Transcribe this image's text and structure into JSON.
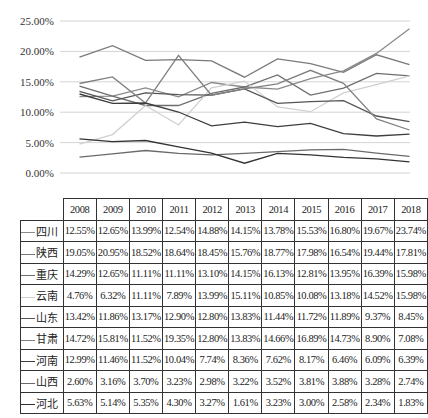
{
  "chart_data": {
    "type": "line",
    "title": "",
    "xlabel": "",
    "ylabel": "",
    "ylim": [
      0,
      25
    ],
    "grid": true,
    "legend_position": "table-left",
    "y_ticks": [
      "25.00%",
      "20.00%",
      "15.00%",
      "10.00%",
      "5.00%",
      "0.00%"
    ],
    "categories": [
      "2008",
      "2009",
      "2010",
      "2011",
      "2012",
      "2013",
      "2014",
      "2015",
      "2016",
      "2017",
      "2018"
    ],
    "series": [
      {
        "name": "四川",
        "color": "#8a8a8a",
        "values": [
          12.55,
          12.65,
          13.99,
          12.54,
          14.88,
          14.15,
          13.78,
          15.53,
          16.8,
          19.67,
          23.74
        ],
        "labels": [
          "12.55%",
          "12.65%",
          "13.99%",
          "12.54%",
          "14.88%",
          "14.15%",
          "13.78%",
          "15.53%",
          "16.80%",
          "19.67%",
          "23.74%"
        ]
      },
      {
        "name": "陕西",
        "color": "#7a7a7a",
        "values": [
          19.05,
          20.95,
          18.52,
          18.64,
          18.45,
          15.76,
          18.77,
          17.98,
          16.54,
          19.44,
          17.81
        ],
        "labels": [
          "19.05%",
          "20.95%",
          "18.52%",
          "18.64%",
          "18.45%",
          "15.76%",
          "18.77%",
          "17.98%",
          "16.54%",
          "19.44%",
          "17.81%"
        ]
      },
      {
        "name": "重庆",
        "color": "#6e6e6e",
        "values": [
          14.29,
          12.65,
          11.11,
          11.11,
          13.1,
          14.15,
          16.13,
          12.81,
          13.95,
          16.39,
          15.98
        ],
        "labels": [
          "14.29%",
          "12.65%",
          "11.11%",
          "11.11%",
          "13.10%",
          "14.15%",
          "16.13%",
          "12.81%",
          "13.95%",
          "16.39%",
          "15.98%"
        ]
      },
      {
        "name": "云南",
        "color": "#d0d0d0",
        "values": [
          4.76,
          6.32,
          11.11,
          7.89,
          13.99,
          15.11,
          10.85,
          10.08,
          13.18,
          14.52,
          15.98
        ],
        "labels": [
          "4.76%",
          "6.32%",
          "11.11%",
          "7.89%",
          "13.99%",
          "15.11%",
          "10.85%",
          "10.08%",
          "13.18%",
          "14.52%",
          "15.98%"
        ]
      },
      {
        "name": "山东",
        "color": "#555555",
        "values": [
          13.42,
          11.86,
          13.17,
          12.9,
          12.8,
          13.83,
          11.44,
          11.72,
          11.89,
          9.37,
          8.45
        ],
        "labels": [
          "13.42%",
          "11.86%",
          "13.17%",
          "12.90%",
          "12.80%",
          "13.83%",
          "11.44%",
          "11.72%",
          "11.89%",
          "9.37%",
          "8.45%"
        ]
      },
      {
        "name": "甘肃",
        "color": "#808080",
        "values": [
          14.72,
          15.81,
          11.52,
          19.35,
          12.8,
          13.83,
          14.66,
          16.89,
          14.73,
          8.9,
          7.08
        ],
        "labels": [
          "14.72%",
          "15.81%",
          "11.52%",
          "19.35%",
          "12.80%",
          "13.83%",
          "14.66%",
          "16.89%",
          "14.73%",
          "8.90%",
          "7.08%"
        ]
      },
      {
        "name": "河南",
        "color": "#3e3e3e",
        "values": [
          12.99,
          11.46,
          11.52,
          10.04,
          7.74,
          8.36,
          7.62,
          8.17,
          6.46,
          6.09,
          6.39
        ],
        "labels": [
          "12.99%",
          "11.46%",
          "11.52%",
          "10.04%",
          "7.74%",
          "8.36%",
          "7.62%",
          "8.17%",
          "6.46%",
          "6.09%",
          "6.39%"
        ]
      },
      {
        "name": "山西",
        "color": "#6a6a6a",
        "values": [
          2.6,
          3.16,
          3.7,
          3.23,
          2.98,
          3.22,
          3.52,
          3.81,
          3.88,
          3.28,
          2.74
        ],
        "labels": [
          "2.60%",
          "3.16%",
          "3.70%",
          "3.23%",
          "2.98%",
          "3.22%",
          "3.52%",
          "3.81%",
          "3.88%",
          "3.28%",
          "2.74%"
        ]
      },
      {
        "name": "河北",
        "color": "#333333",
        "values": [
          5.63,
          5.14,
          5.35,
          4.3,
          3.27,
          1.61,
          3.23,
          3.0,
          2.58,
          2.34,
          1.83
        ],
        "labels": [
          "5.63%",
          "5.14%",
          "5.35%",
          "4.30%",
          "3.27%",
          "1.61%",
          "3.23%",
          "3.00%",
          "2.58%",
          "2.34%",
          "1.83%"
        ]
      }
    ]
  }
}
